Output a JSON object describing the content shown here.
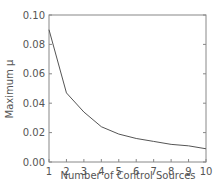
{
  "chart_data": {
    "type": "line",
    "title": "",
    "xlabel": "Number of Control Sources",
    "ylabel": "Maximum  μ",
    "x": [
      1,
      2,
      3,
      4,
      5,
      6,
      7,
      8,
      9,
      10
    ],
    "series": [
      {
        "name": "Maximum μ",
        "values": [
          0.09,
          0.047,
          0.034,
          0.024,
          0.019,
          0.016,
          0.014,
          0.012,
          0.011,
          0.009
        ]
      }
    ],
    "xlim": [
      1,
      10
    ],
    "ylim": [
      0.0,
      0.1
    ],
    "xticks": [
      "1",
      "2",
      "3",
      "4",
      "5",
      "6",
      "7",
      "8",
      "9",
      "10"
    ],
    "yticks": [
      "0.00",
      "0.02",
      "0.04",
      "0.06",
      "0.08",
      "0.10"
    ],
    "grid": false,
    "legend": "none"
  }
}
